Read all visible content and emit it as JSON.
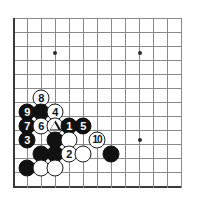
{
  "board": {
    "title": "Go board diagram",
    "grid": {
      "columns": 13,
      "rows": 13,
      "origin_x": 13,
      "origin_y": 18,
      "spacing": 14,
      "line_color": "#8a8a8a",
      "edge_color": "#3a3a3a",
      "background": "#ffffff"
    },
    "edges": {
      "left_thick": true,
      "bottom_thick": true,
      "top_thick": false,
      "right_thick": false
    },
    "star_points": [
      {
        "name": "star-point-upper-left",
        "x": 55,
        "y": 53
      },
      {
        "name": "star-point-upper-right",
        "x": 140,
        "y": 53
      },
      {
        "name": "star-point-lower-right",
        "x": 140,
        "y": 140
      }
    ],
    "stones": [
      {
        "name": "stone-move-8",
        "color": "white",
        "label": "8",
        "x": 41,
        "y": 98
      },
      {
        "name": "stone-black-plain-a",
        "color": "black",
        "label": "",
        "x": 41,
        "y": 112
      },
      {
        "name": "stone-move-9",
        "color": "black",
        "label": "9",
        "x": 27,
        "y": 112
      },
      {
        "name": "stone-move-4",
        "color": "white",
        "label": "4",
        "x": 55,
        "y": 112
      },
      {
        "name": "stone-move-7",
        "color": "black",
        "label": "7",
        "x": 27,
        "y": 126
      },
      {
        "name": "stone-move-6",
        "color": "white",
        "label": "6",
        "x": 41,
        "y": 126
      },
      {
        "name": "stone-triangle-mark",
        "color": "white",
        "label": "triangle",
        "x": 55,
        "y": 126
      },
      {
        "name": "stone-move-1",
        "color": "black",
        "label": "1",
        "x": 69,
        "y": 126
      },
      {
        "name": "stone-move-5",
        "color": "black",
        "label": "5",
        "x": 83,
        "y": 126
      },
      {
        "name": "stone-move-3",
        "color": "black",
        "label": "3",
        "x": 27,
        "y": 140
      },
      {
        "name": "stone-black-plain-b",
        "color": "black",
        "label": "",
        "x": 55,
        "y": 140
      },
      {
        "name": "stone-white-plain-a",
        "color": "white",
        "label": "",
        "x": 69,
        "y": 140
      },
      {
        "name": "stone-move-10",
        "color": "white",
        "label": "10",
        "x": 97,
        "y": 140
      },
      {
        "name": "stone-black-plain-c",
        "color": "black",
        "label": "",
        "x": 41,
        "y": 154
      },
      {
        "name": "stone-black-plain-d",
        "color": "black",
        "label": "",
        "x": 55,
        "y": 154
      },
      {
        "name": "stone-move-2",
        "color": "white",
        "label": "2",
        "x": 69,
        "y": 154
      },
      {
        "name": "stone-white-plain-b",
        "color": "white",
        "label": "",
        "x": 83,
        "y": 154
      },
      {
        "name": "stone-black-plain-e",
        "color": "black",
        "label": "",
        "x": 111,
        "y": 154
      },
      {
        "name": "stone-black-plain-f",
        "color": "black",
        "label": "",
        "x": 27,
        "y": 168
      },
      {
        "name": "stone-white-plain-c",
        "color": "white",
        "label": "",
        "x": 41,
        "y": 168
      },
      {
        "name": "stone-white-plain-d",
        "color": "white",
        "label": "",
        "x": 55,
        "y": 168
      }
    ]
  }
}
